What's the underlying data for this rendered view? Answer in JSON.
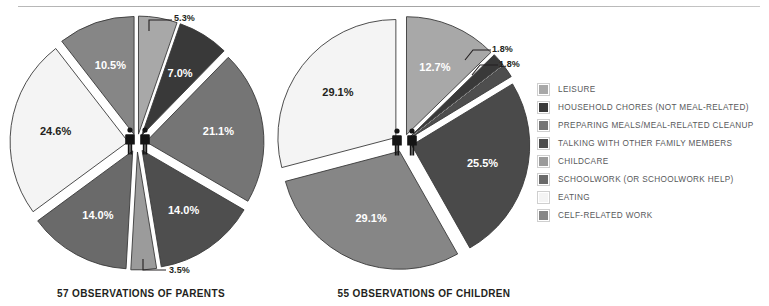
{
  "page": {
    "background": "#ffffff",
    "rule_color": "#b0b0b0"
  },
  "legend": {
    "items": [
      {
        "label": "LEISURE",
        "color": "#a8a8a8"
      },
      {
        "label": "HOUSEHOLD CHORES (NOT MEAL-RELATED)",
        "color": "#393939"
      },
      {
        "label": "PREPARING MEALS/MEAL-RELATED CLEANUP",
        "color": "#757575"
      },
      {
        "label": "TALKING WITH OTHER FAMILY MEMBERS",
        "color": "#4e4e4e"
      },
      {
        "label": "CHILDCARE",
        "color": "#9b9b9b"
      },
      {
        "label": "SCHOOLWORK (OR SCHOOLWORK HELP)",
        "color": "#6a6a6a"
      },
      {
        "label": "EATING",
        "color": "#f4f4f4"
      },
      {
        "label": "CELF-RELATED WORK",
        "color": "#868686"
      }
    ]
  },
  "chart_data": [
    {
      "type": "pie",
      "id": "parents",
      "title": "57 OBSERVATIONS OF PARENTS",
      "observations": 57,
      "legend_position": "right",
      "exploded": true,
      "categories": [
        "LEISURE",
        "HOUSEHOLD CHORES (NOT MEAL-RELATED)",
        "PREPARING MEALS/MEAL-RELATED CLEANUP",
        "TALKING WITH OTHER FAMILY MEMBERS",
        "CHILDCARE",
        "SCHOOLWORK (OR SCHOOLWORK HELP)",
        "EATING",
        "CELF-RELATED WORK"
      ],
      "values": [
        5.3,
        7.0,
        21.1,
        14.0,
        3.5,
        14.0,
        24.6,
        10.5
      ],
      "labels": [
        "5.3%",
        "7.0%",
        "21.1%",
        "14.0%",
        "3.5%",
        "14.0%",
        "24.6%",
        "10.5%"
      ],
      "colors": [
        "#a8a8a8",
        "#393939",
        "#757575",
        "#4e4e4e",
        "#9b9b9b",
        "#6a6a6a",
        "#f4f4f4",
        "#868686"
      ],
      "callouts": [
        "5.3%",
        "3.5%"
      ]
    },
    {
      "type": "pie",
      "id": "children",
      "title": "55 OBSERVATIONS OF CHILDREN",
      "observations": 55,
      "legend_position": "right",
      "exploded": true,
      "categories": [
        "LEISURE",
        "HOUSEHOLD CHORES (NOT MEAL-RELATED)",
        "PREPARING MEALS/MEAL-RELATED CLEANUP",
        "TALKING WITH OTHER FAMILY MEMBERS",
        "SCHOOLWORK (OR SCHOOLWORK HELP)",
        "EATING"
      ],
      "values": [
        12.7,
        1.8,
        1.8,
        25.5,
        29.1,
        29.1
      ],
      "labels": [
        "12.7%",
        "1.8%",
        "1.8%",
        "25.5%",
        "29.1%",
        "29.1%"
      ],
      "colors": [
        "#a8a8a8",
        "#393939",
        "#4e4e4e",
        "#4a4a4a",
        "#868686",
        "#f4f4f4"
      ],
      "callouts": [
        "1.8%",
        "1.8%"
      ]
    }
  ],
  "charts": {
    "parents": {
      "caption": "57 OBSERVATIONS OF PARENTS",
      "slices": [
        {
          "label": "5.3%",
          "value": 5.3,
          "color": "#a8a8a8",
          "label_color": "#ffffff",
          "label_hidden": true
        },
        {
          "label": "7.0%",
          "value": 7.0,
          "color": "#393939",
          "label_color": "#ffffff"
        },
        {
          "label": "21.1%",
          "value": 21.1,
          "color": "#757575",
          "label_color": "#ffffff"
        },
        {
          "label": "14.0%",
          "value": 14.0,
          "color": "#4e4e4e",
          "label_color": "#ffffff"
        },
        {
          "label": "3.5%",
          "value": 3.5,
          "color": "#9b9b9b",
          "label_color": "#ffffff",
          "label_hidden": true
        },
        {
          "label": "14.0%",
          "value": 14.0,
          "color": "#6a6a6a",
          "label_color": "#ffffff"
        },
        {
          "label": "24.6%",
          "value": 24.6,
          "color": "#f4f4f4",
          "label_color": "#231f20"
        },
        {
          "label": "10.5%",
          "value": 10.5,
          "color": "#868686",
          "label_color": "#ffffff"
        }
      ],
      "callout_top": "5.3%",
      "callout_bottom": "3.5%"
    },
    "children": {
      "caption": "55 OBSERVATIONS OF CHILDREN",
      "slices": [
        {
          "label": "12.7%",
          "value": 12.7,
          "color": "#a8a8a8",
          "label_color": "#ffffff"
        },
        {
          "label": "1.8%",
          "value": 1.8,
          "color": "#393939",
          "label_color": "#ffffff",
          "label_hidden": true
        },
        {
          "label": "1.8%",
          "value": 1.8,
          "color": "#4e4e4e",
          "label_color": "#ffffff",
          "label_hidden": true
        },
        {
          "label": "25.5%",
          "value": 25.5,
          "color": "#4a4a4a",
          "label_color": "#ffffff"
        },
        {
          "label": "29.1%",
          "value": 29.1,
          "color": "#868686",
          "label_color": "#ffffff"
        },
        {
          "label": "29.1%",
          "value": 29.1,
          "color": "#f4f4f4",
          "label_color": "#231f20"
        }
      ],
      "callout_top": "1.8%",
      "callout_bottom": "1.8%"
    }
  }
}
